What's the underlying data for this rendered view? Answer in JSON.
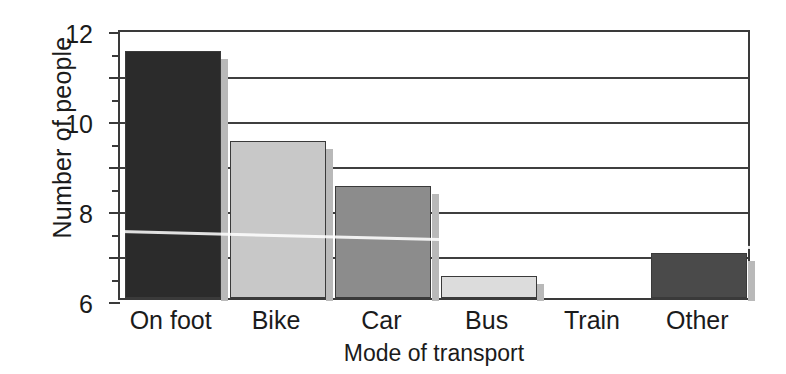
{
  "chart_data": {
    "type": "bar",
    "title": "",
    "subtitle": "",
    "xlabel": "Mode of transport",
    "ylabel": "Number of people",
    "categories": [
      "On foot",
      "Bike",
      "Car",
      "Bus",
      "Train",
      "Other"
    ],
    "values": [
      11,
      7,
      5,
      1,
      0,
      2
    ],
    "bar_colors": [
      "#2b2b2b",
      "#c8c8c8",
      "#8c8c8c",
      "#dcdcdc",
      "#ffffff",
      "#4a4a4a"
    ],
    "ylim": [
      0,
      12
    ],
    "xlim_note": "categorical",
    "y_major_ticks": [
      0,
      2,
      4,
      6,
      8,
      10,
      12
    ],
    "y_minor_ticks": [
      1,
      3,
      5,
      7,
      9,
      11
    ],
    "y_tick_labels": [
      "0",
      "2",
      "4",
      "6",
      "8",
      "10",
      "12"
    ],
    "grid": "horizontal-major-only",
    "legend": "none",
    "legend_position": "none",
    "annotations": [],
    "frame_color": "#3a3a3a",
    "gridline_color": "#3f3f3f",
    "background": "#ffffff"
  }
}
